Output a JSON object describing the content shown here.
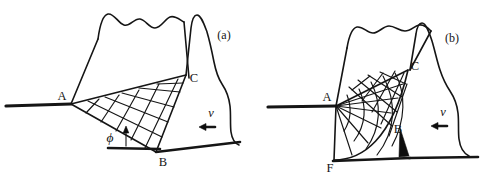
{
  "figure": {
    "type": "technical-diagram",
    "background_color": "#ffffff",
    "line_color": "#151515",
    "panels": [
      {
        "id": "a",
        "caption": "(a)",
        "model": "shear-plane (parallelogram distorted grid)",
        "points": [
          {
            "name": "A",
            "label": "A",
            "role": "shear zone upper/left origin at workpiece surface"
          },
          {
            "name": "B",
            "label": "B",
            "role": "shear plane lower end at machined surface"
          },
          {
            "name": "C",
            "label": "C",
            "role": "shear zone end at tool rake face"
          }
        ],
        "angle": {
          "symbol": "ϕ",
          "name": "phi",
          "meaning": "shear angle measured from machined surface"
        },
        "velocity": {
          "symbol": "ν",
          "name": "nu",
          "direction": "left",
          "meaning": "cutting velocity"
        }
      },
      {
        "id": "b",
        "caption": "(b)",
        "model": "shear-fan (radial fan distorted grid)",
        "points": [
          {
            "name": "A",
            "label": "A",
            "role": "fan apex at workpiece surface"
          },
          {
            "name": "B",
            "label": "B",
            "role": "fan boundary at tool rake face"
          },
          {
            "name": "C",
            "label": "C",
            "role": "chip contact end at tool rake face"
          },
          {
            "name": "F",
            "label": "F",
            "role": "lower fan boundary at machined surface"
          }
        ],
        "velocity": {
          "symbol": "ν",
          "name": "nu",
          "direction": "left",
          "meaning": "cutting velocity"
        }
      }
    ]
  },
  "labels": {
    "panel_a": "(a)",
    "panel_b": "(b)",
    "a_point_A": "A",
    "a_point_B": "B",
    "a_point_C": "C",
    "a_phi": "ϕ",
    "a_nu": "ν",
    "b_point_A": "A",
    "b_point_B": "B",
    "b_point_C": "C",
    "b_point_F": "F",
    "b_nu": "ν"
  }
}
